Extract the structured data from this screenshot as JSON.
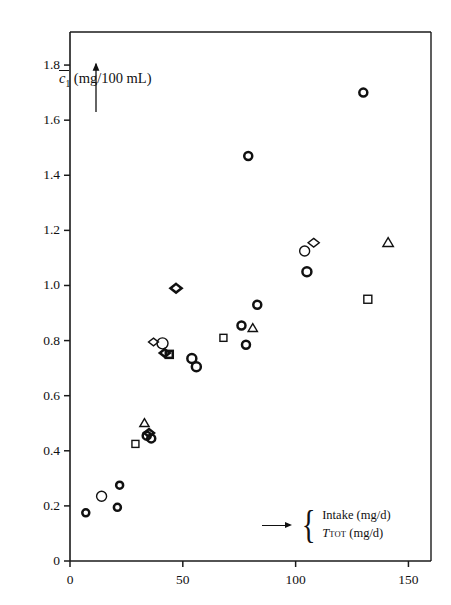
{
  "chart_data": {
    "type": "scatter",
    "title": "",
    "xlabel": "Intake (mg/d) / T_TOT (mg/d)",
    "ylabel": "c̄₁ (mg/100 mL)",
    "xlim": [
      0,
      160
    ],
    "ylim": [
      0,
      1.92
    ],
    "grid": false,
    "legend_position": "inside-bottom-right",
    "x_ticks": [
      {
        "value": 0,
        "label": "0"
      },
      {
        "value": 50,
        "label": "50"
      },
      {
        "value": 100,
        "label": "100"
      },
      {
        "value": 150,
        "label": "150"
      }
    ],
    "y_ticks": [
      {
        "value": 0,
        "label": "0"
      },
      {
        "value": 0.2,
        "label": "0.2"
      },
      {
        "value": 0.4,
        "label": "0.4"
      },
      {
        "value": 0.6,
        "label": "0.6"
      },
      {
        "value": 0.8,
        "label": "0.8"
      },
      {
        "value": 1.0,
        "label": "1.0"
      },
      {
        "value": 1.2,
        "label": "1.2"
      },
      {
        "value": 1.4,
        "label": "1.4"
      },
      {
        "value": 1.6,
        "label": "1.6"
      },
      {
        "value": 1.8,
        "label": "1.8"
      }
    ],
    "marker_shapes": [
      "circle",
      "square",
      "triangle",
      "diamond"
    ],
    "points": [
      {
        "x": 7,
        "y": 0.175,
        "shape": "circle",
        "size": 7,
        "weight": "bold"
      },
      {
        "x": 14,
        "y": 0.235,
        "shape": "circle",
        "size": 10,
        "weight": "thin"
      },
      {
        "x": 21,
        "y": 0.195,
        "shape": "circle",
        "size": 7,
        "weight": "bold"
      },
      {
        "x": 22,
        "y": 0.275,
        "shape": "circle",
        "size": 7,
        "weight": "bold"
      },
      {
        "x": 29,
        "y": 0.425,
        "shape": "square",
        "size": 7,
        "weight": "thin"
      },
      {
        "x": 33,
        "y": 0.5,
        "shape": "triangle",
        "size": 8,
        "weight": "thin"
      },
      {
        "x": 34,
        "y": 0.455,
        "shape": "circle",
        "size": 8,
        "weight": "bold"
      },
      {
        "x": 36,
        "y": 0.445,
        "shape": "circle",
        "size": 8,
        "weight": "bold"
      },
      {
        "x": 35,
        "y": 0.465,
        "shape": "diamond",
        "size": 8,
        "weight": "bold"
      },
      {
        "x": 37,
        "y": 0.795,
        "shape": "diamond",
        "size": 8,
        "weight": "thin"
      },
      {
        "x": 41,
        "y": 0.79,
        "shape": "circle",
        "size": 11,
        "weight": "thin"
      },
      {
        "x": 42,
        "y": 0.755,
        "shape": "diamond",
        "size": 8,
        "weight": "bold"
      },
      {
        "x": 44,
        "y": 0.75,
        "shape": "square",
        "size": 7,
        "weight": "bold"
      },
      {
        "x": 47,
        "y": 0.99,
        "shape": "diamond",
        "size": 9,
        "weight": "bold"
      },
      {
        "x": 54,
        "y": 0.735,
        "shape": "circle",
        "size": 9,
        "weight": "bold"
      },
      {
        "x": 56,
        "y": 0.705,
        "shape": "circle",
        "size": 9,
        "weight": "bold"
      },
      {
        "x": 68,
        "y": 0.81,
        "shape": "square",
        "size": 7,
        "weight": "thin"
      },
      {
        "x": 76,
        "y": 0.855,
        "shape": "circle",
        "size": 8,
        "weight": "bold"
      },
      {
        "x": 81,
        "y": 0.845,
        "shape": "triangle",
        "size": 8,
        "weight": "thin"
      },
      {
        "x": 78,
        "y": 0.785,
        "shape": "circle",
        "size": 8,
        "weight": "bold"
      },
      {
        "x": 83,
        "y": 0.93,
        "shape": "circle",
        "size": 8,
        "weight": "bold"
      },
      {
        "x": 79,
        "y": 1.47,
        "shape": "circle",
        "size": 8,
        "weight": "bold"
      },
      {
        "x": 104,
        "y": 1.125,
        "shape": "circle",
        "size": 10,
        "weight": "thin"
      },
      {
        "x": 108,
        "y": 1.155,
        "shape": "diamond",
        "size": 9,
        "weight": "thin"
      },
      {
        "x": 105,
        "y": 1.05,
        "shape": "circle",
        "size": 9,
        "weight": "bold"
      },
      {
        "x": 130,
        "y": 1.7,
        "shape": "circle",
        "size": 8,
        "weight": "bold"
      },
      {
        "x": 132,
        "y": 0.95,
        "shape": "square",
        "size": 8,
        "weight": "thin"
      },
      {
        "x": 141,
        "y": 1.155,
        "shape": "triangle",
        "size": 9,
        "weight": "thin"
      }
    ]
  },
  "axis": {
    "y_label_prefix": "c",
    "y_label_sub": "1",
    "y_label_units": "(mg/100 mL)",
    "y_arrow_name": "y-axis-direction-arrow"
  },
  "legend": {
    "arrow": "right-arrow-icon",
    "brace": "{",
    "line1": "Intake (mg/d)",
    "line2_symbol": "T",
    "line2_sub": "TOT",
    "line2_units": "(mg/d)"
  },
  "colors": {
    "ink": "#111111",
    "background": "#ffffff",
    "axis": "#1a1a1a"
  }
}
